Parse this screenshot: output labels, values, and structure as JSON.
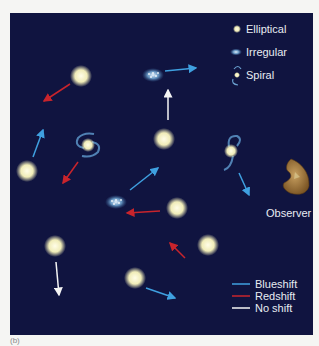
{
  "caption": "(b)",
  "colors": {
    "background": "#101440",
    "blueshift": "#3fa0e0",
    "redshift": "#c8242c",
    "no_shift": "#f4f4f4",
    "elliptical": "#f4f0c8",
    "observer": "#a8783a"
  },
  "galaxy_legend": [
    {
      "type": "elliptical",
      "label": "Elliptical"
    },
    {
      "type": "irregular",
      "label": "Irregular"
    },
    {
      "type": "spiral",
      "label": "Spiral"
    }
  ],
  "shift_legend": [
    {
      "type": "blueshift",
      "label": "Blueshift"
    },
    {
      "type": "redshift",
      "label": "Redshift"
    },
    {
      "type": "no_shift",
      "label": "No shift"
    }
  ],
  "observer": {
    "label": "Observer"
  },
  "galaxies": [
    {
      "type": "elliptical",
      "x": 81,
      "y": 76,
      "motion": "redshift",
      "arrow": [
        70,
        84,
        44,
        101
      ]
    },
    {
      "type": "irregular",
      "x": 153,
      "y": 75,
      "motion": "blueshift",
      "arrow": [
        165,
        71,
        196,
        68
      ]
    },
    {
      "type": "elliptical",
      "x": 164,
      "y": 139,
      "motion": "no_shift",
      "arrow": [
        168,
        120,
        168,
        90
      ]
    },
    {
      "type": "elliptical",
      "x": 27,
      "y": 171,
      "motion": "blueshift",
      "arrow": [
        33,
        157,
        43,
        130
      ]
    },
    {
      "type": "spiral",
      "x": 88,
      "y": 145,
      "motion": "redshift",
      "arrow": [
        78,
        162,
        63,
        183
      ]
    },
    {
      "type": "spiral",
      "x": 231,
      "y": 151,
      "motion": "blueshift",
      "arrow": [
        239,
        173,
        249,
        195
      ]
    },
    {
      "type": "irregular",
      "x": 116,
      "y": 202,
      "motion": "blueshift",
      "arrow": [
        130,
        190,
        158,
        168
      ]
    },
    {
      "type": "elliptical",
      "x": 177,
      "y": 208,
      "motion": "redshift",
      "arrow": [
        160,
        211,
        127,
        213
      ]
    },
    {
      "type": "elliptical",
      "x": 55,
      "y": 246,
      "motion": "no_shift",
      "arrow": [
        56,
        262,
        59,
        295
      ]
    },
    {
      "type": "elliptical",
      "x": 208,
      "y": 245,
      "motion": "redshift",
      "arrow": [
        185,
        258,
        170,
        243
      ]
    },
    {
      "type": "elliptical",
      "x": 135,
      "y": 278,
      "motion": "blueshift",
      "arrow": [
        146,
        288,
        175,
        298
      ]
    }
  ]
}
